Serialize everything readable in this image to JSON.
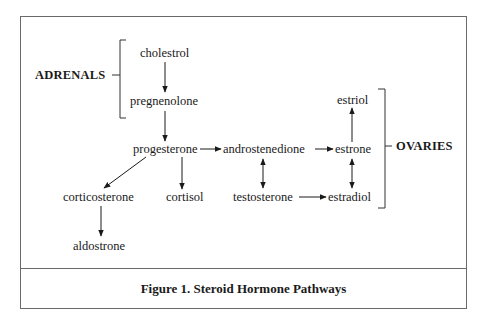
{
  "figure": {
    "caption": "Figure 1. Steroid Hormone Pathways"
  },
  "groups": {
    "adrenals": {
      "label": "ADRENALS"
    },
    "ovaries": {
      "label": "OVARIES"
    }
  },
  "nodes": {
    "cholestrol": "cholestrol",
    "pregnenolone": "pregnenolone",
    "progesterone": "progesterone",
    "androstenedione": "androstenedione",
    "estrone": "estrone",
    "estriol": "estriol",
    "corticosterone": "corticosterone",
    "cortisol": "cortisol",
    "testosterone": "testosterone",
    "estradiol": "estradiol",
    "aldostrone": "aldostrone"
  },
  "edges": [
    {
      "from": "cholestrol",
      "to": "pregnenolone",
      "type": "one-way"
    },
    {
      "from": "pregnenolone",
      "to": "progesterone",
      "type": "one-way"
    },
    {
      "from": "progesterone",
      "to": "androstenedione",
      "type": "one-way"
    },
    {
      "from": "androstenedione",
      "to": "estrone",
      "type": "one-way"
    },
    {
      "from": "estrone",
      "to": "estriol",
      "type": "one-way"
    },
    {
      "from": "progesterone",
      "to": "corticosterone",
      "type": "one-way"
    },
    {
      "from": "progesterone",
      "to": "cortisol",
      "type": "one-way"
    },
    {
      "from": "corticosterone",
      "to": "aldostrone",
      "type": "one-way"
    },
    {
      "from": "androstenedione",
      "to": "testosterone",
      "type": "two-way"
    },
    {
      "from": "estrone",
      "to": "estradiol",
      "type": "two-way"
    },
    {
      "from": "testosterone",
      "to": "estradiol",
      "type": "one-way"
    }
  ],
  "colors": {
    "ink": "#1a1a1a",
    "frame": "#6a6a6a",
    "background": "#ffffff"
  }
}
